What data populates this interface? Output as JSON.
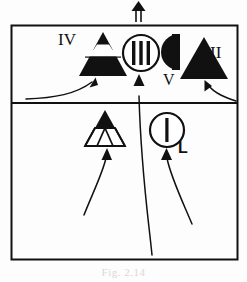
{
  "figure": {
    "caption": "Fig. 2.14",
    "background_color": "#fdfdfd",
    "ink_color": "#111111",
    "frame": {
      "border_color": "#111111",
      "upper_panel_label": "",
      "lower_panel_label": ""
    },
    "top_arrow": {
      "name": "north-arrow",
      "direction": "up",
      "style": "double-line"
    },
    "symbols": [
      {
        "id": "sym-iv",
        "label": "IV",
        "label_position": "left",
        "shape": "banded-triangle",
        "description": "Filled triangle with a white horizontal band containing a white trapezoid",
        "panel": "upper"
      },
      {
        "id": "sym-iii",
        "label": "III",
        "label_position": "inside",
        "shape": "circle-three-bars",
        "description": "Open circle containing three vertical bars",
        "panel": "upper"
      },
      {
        "id": "sym-v",
        "label": "V",
        "label_position": "below",
        "shape": "half-disc",
        "description": "Filled half disc with flat vertical right edge",
        "panel": "upper"
      },
      {
        "id": "sym-ii",
        "label": "II",
        "label_position": "right",
        "shape": "filled-triangle",
        "description": "Solid filled triangle",
        "panel": "upper"
      },
      {
        "id": "sym-subdivided",
        "label": "",
        "label_position": "none",
        "shape": "subdivided-triangle",
        "description": "Triangle with filled top half and lower half split into three small triangles",
        "panel": "lower"
      },
      {
        "id": "sym-i",
        "label": "L",
        "label_position": "right",
        "shape": "circle-one-bar",
        "description": "Open circle containing one vertical bar",
        "panel": "lower"
      }
    ],
    "arrows": [
      {
        "id": "arrow-to-iv",
        "from": "lower-left-margin",
        "to": "sym-iv",
        "curve": "s-curve"
      },
      {
        "id": "arrow-to-iii",
        "from": "lower-panel-bottom",
        "to": "sym-iii",
        "curve": "long-sweep"
      },
      {
        "id": "arrow-to-ii",
        "from": "right-margin",
        "to": "sym-ii",
        "curve": "hook"
      },
      {
        "id": "arrow-to-tri",
        "from": "lower-panel-bottom",
        "to": "sym-subdivided",
        "curve": "long-sweep"
      },
      {
        "id": "arrow-to-l",
        "from": "lower-panel-bottom",
        "to": "sym-i",
        "curve": "long-sweep"
      }
    ]
  }
}
